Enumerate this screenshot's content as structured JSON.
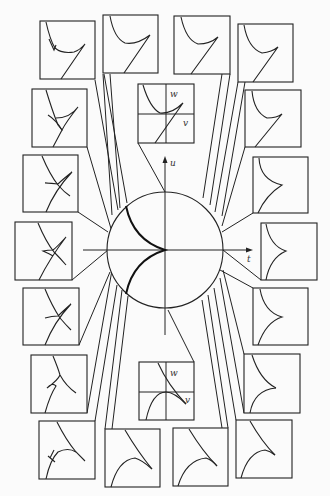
{
  "figure": {
    "axes": {
      "u_label": "u",
      "t_label": "t"
    },
    "center_top_panel": {
      "w_label": "w",
      "v_label": "v"
    },
    "center_bottom_panel": {
      "w_label": "w",
      "v_label": "v"
    },
    "panel_count": 20,
    "colors": {
      "ink": "#222222",
      "paper": "#fbfbfb"
    }
  }
}
